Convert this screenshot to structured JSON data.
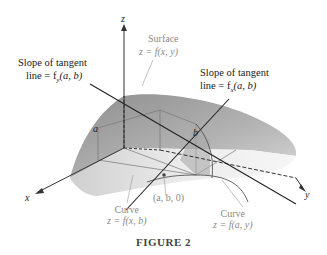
{
  "figure": {
    "caption": "FIGURE 2",
    "axes": {
      "x": "x",
      "y": "y",
      "z": "z"
    },
    "point_labels": {
      "a": "a",
      "b": "b",
      "base_point": "(a, b, 0)"
    },
    "surface": {
      "line1": "Surface",
      "line2": "z = f(x, y)"
    },
    "slope_y": {
      "line1": "Slope of tangent",
      "line2": "line = f",
      "sub": "y",
      "args": "(a, b)"
    },
    "slope_x": {
      "line1": "Slope of tangent",
      "line2": "line = f",
      "sub": "x",
      "args": "(a, b)"
    },
    "curve_xb": {
      "line1": "Curve",
      "line2": "z = f(x, b)"
    },
    "curve_ay": {
      "line1": "Curve",
      "line2": "z = f(a, y)"
    }
  }
}
